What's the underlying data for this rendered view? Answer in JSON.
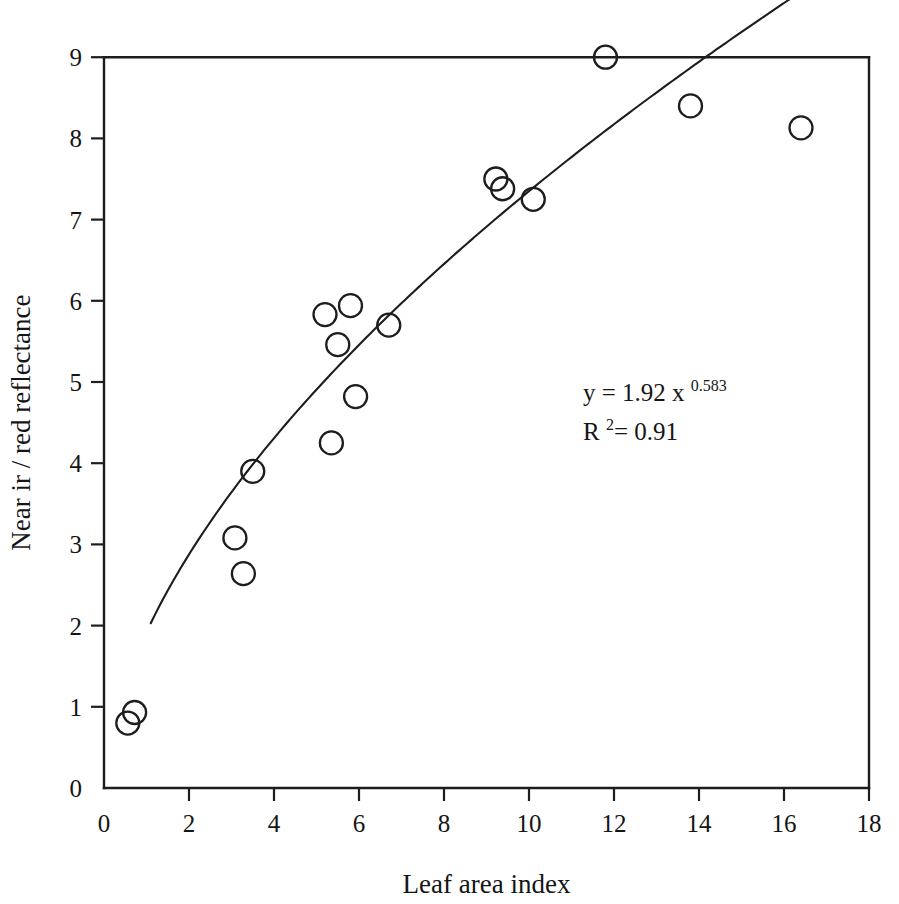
{
  "chart_data": {
    "type": "scatter",
    "title": "",
    "xlabel": "Leaf area index",
    "ylabel": "Near ir / red reflectance",
    "xlim": [
      0,
      18
    ],
    "ylim": [
      0,
      9
    ],
    "xticks": [
      0,
      2,
      4,
      6,
      8,
      10,
      12,
      14,
      16,
      18
    ],
    "yticks": [
      0,
      1,
      2,
      3,
      4,
      5,
      6,
      7,
      8,
      9
    ],
    "xticklabels": [
      "0",
      "2",
      "4",
      "6",
      "8",
      "10",
      "12",
      "14",
      "16",
      "18"
    ],
    "yticklabels": [
      "0",
      "1",
      "2",
      "3",
      "4",
      "5",
      "6",
      "7",
      "8",
      "9"
    ],
    "grid": false,
    "legend": false,
    "marker": "open-circle",
    "marker_color": "#1d1d1d",
    "points": [
      {
        "x": 0.56,
        "y": 0.8
      },
      {
        "x": 0.72,
        "y": 0.93
      },
      {
        "x": 3.08,
        "y": 3.08
      },
      {
        "x": 3.28,
        "y": 2.64
      },
      {
        "x": 3.5,
        "y": 3.9
      },
      {
        "x": 5.2,
        "y": 5.83
      },
      {
        "x": 5.35,
        "y": 4.25
      },
      {
        "x": 5.5,
        "y": 5.46
      },
      {
        "x": 5.8,
        "y": 5.94
      },
      {
        "x": 5.92,
        "y": 4.82
      },
      {
        "x": 6.7,
        "y": 5.7
      },
      {
        "x": 9.22,
        "y": 7.5
      },
      {
        "x": 9.38,
        "y": 7.38
      },
      {
        "x": 10.1,
        "y": 7.25
      },
      {
        "x": 11.8,
        "y": 9.0
      },
      {
        "x": 13.8,
        "y": 8.4
      },
      {
        "x": 16.4,
        "y": 8.13
      }
    ],
    "fit": {
      "kind": "power",
      "coefficient": 1.92,
      "exponent": 0.583,
      "r_squared": 0.91,
      "x_start": 1.1,
      "x_end": 17.6
    },
    "annotations": {
      "equation_lead": "y = 1.92 x",
      "equation_exponent": "0.583",
      "r_lead": "R",
      "r_exponent": "2",
      "r_value": "= 0.91"
    }
  }
}
